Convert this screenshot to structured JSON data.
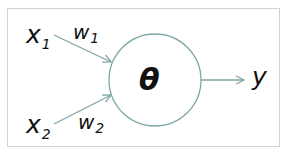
{
  "diagram": {
    "type": "perceptron",
    "inputs": [
      {
        "var": "x",
        "sub": "1",
        "weight_var": "w",
        "weight_sub": "1"
      },
      {
        "var": "x",
        "sub": "2",
        "weight_var": "w",
        "weight_sub": "2"
      }
    ],
    "node_label": "θ",
    "output_label": "y",
    "colors": {
      "edge": "#7fa6a6",
      "text": "#111111",
      "border": "#cfd3d3"
    }
  }
}
